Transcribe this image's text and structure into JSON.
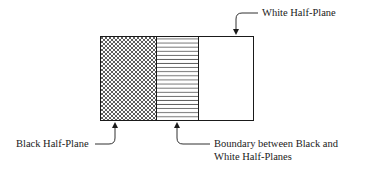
{
  "diagram": {
    "regions": [
      {
        "name": "Black Half-Plane",
        "pattern": "crosshatch"
      },
      {
        "name": "Boundary between Black and White Half-Planes",
        "pattern": "horizontal-lines"
      },
      {
        "name": "White Half-Plane",
        "pattern": "none"
      }
    ],
    "labels": {
      "white": "White Half-Plane",
      "black": "Black Half-Plane",
      "boundary_line1": "Boundary between Black and",
      "boundary_line2": "White Half-Planes"
    },
    "colors": {
      "ink": "#1a1a1a",
      "background": "#ffffff"
    }
  }
}
